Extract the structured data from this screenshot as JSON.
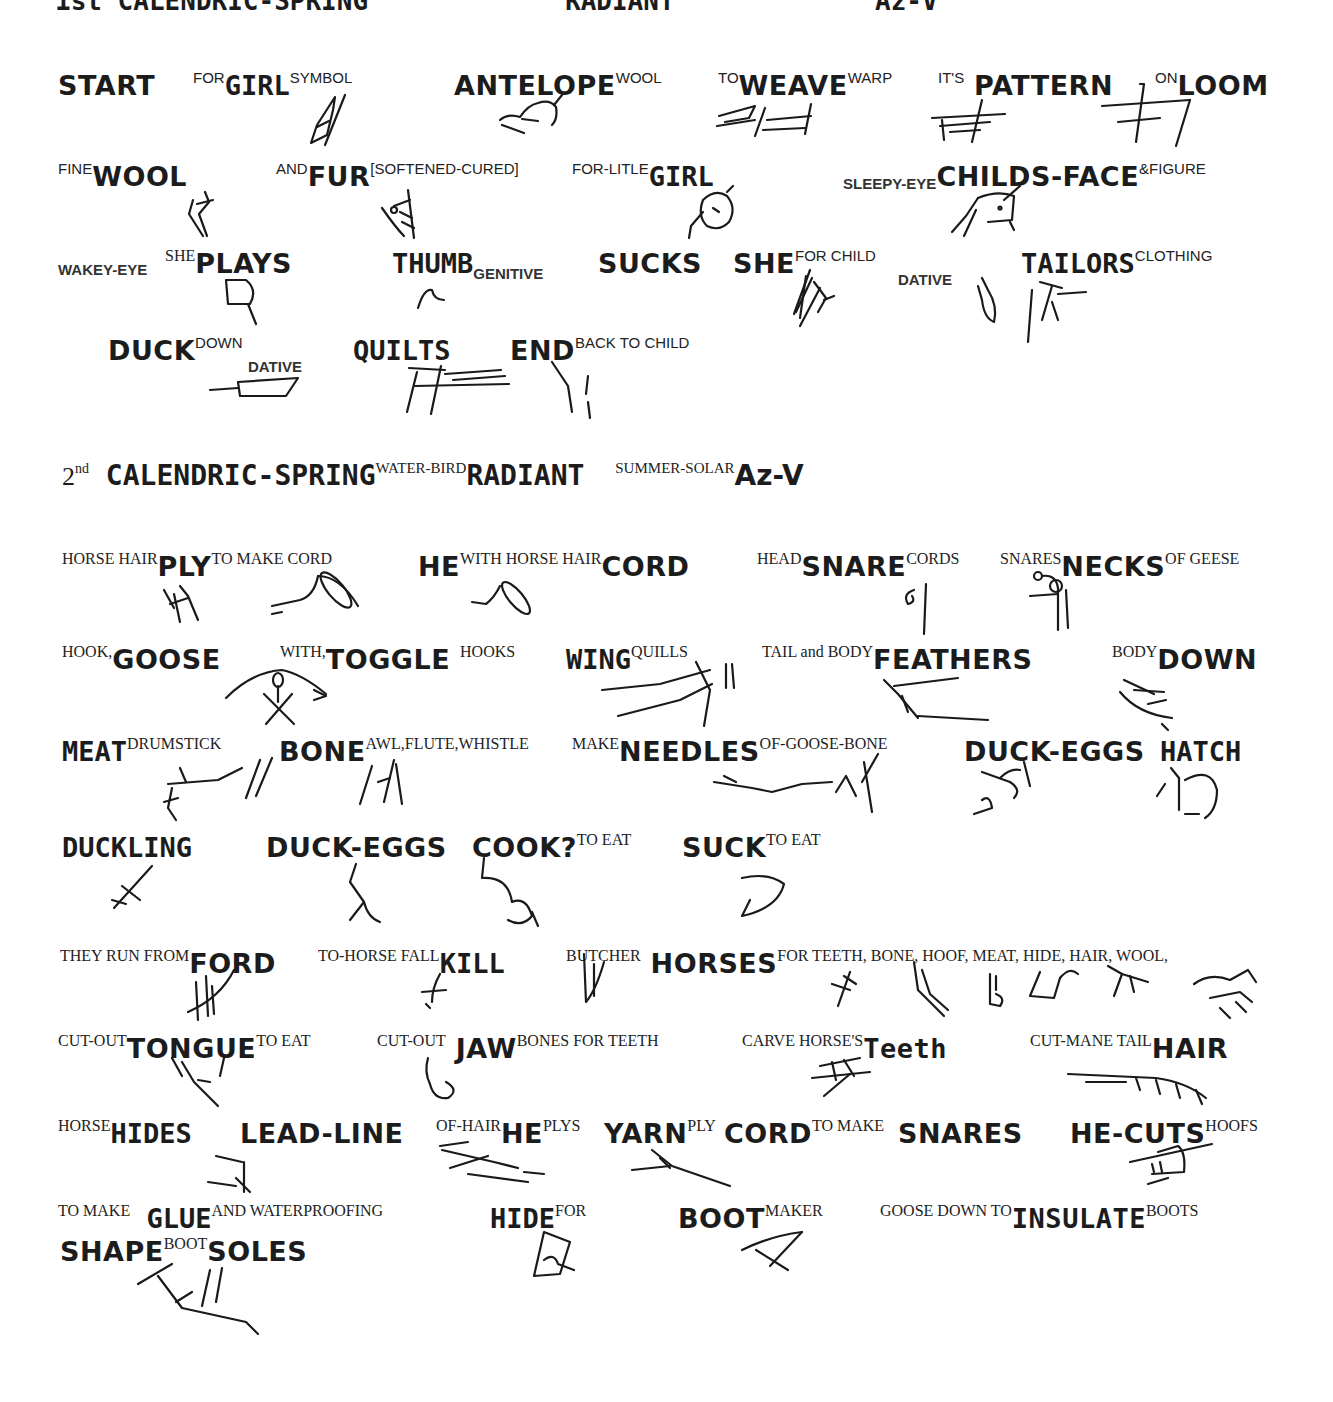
{
  "header_cutoff": {
    "text": "1st CALENDRIC-SPRING",
    "right_a": "RADIANT",
    "right_b": "Az-V"
  },
  "section1": {
    "rows": [
      [
        {
          "pre": "",
          "word": "START",
          "post": ""
        },
        {
          "pre": "FOR",
          "word": "GIRL",
          "post": "SYMBOL"
        },
        {
          "pre": "",
          "word": "ANTELOPE",
          "post": "WOOL"
        },
        {
          "pre": "TO",
          "word": "WEAVE",
          "post": "WARP"
        },
        {
          "pre": "IT'S",
          "word": "PATTERN",
          "post": ""
        },
        {
          "pre": "ON",
          "word": "LOOM",
          "post": ""
        }
      ],
      [
        {
          "pre": "FINE",
          "word": "WOOL",
          "post": ""
        },
        {
          "pre": "AND",
          "word": "FUR",
          "post": "[SOFTENED-CURED]"
        },
        {
          "pre": "FOR-LITLE",
          "word": "GIRL",
          "post": ""
        },
        {
          "pre": "SLEEPY-EYE",
          "word": "CHILDS-FACE",
          "post": "&FIGURE"
        }
      ],
      [
        {
          "pre": "WAKEY-EYE",
          "word": "",
          "post": ""
        },
        {
          "pre": "SHE",
          "word": "PLAYS",
          "post": ""
        },
        {
          "pre": "",
          "word": "THUMB",
          "sub": "GENITIVE",
          "post": ""
        },
        {
          "pre": "",
          "word": "SUCKS",
          "post": ""
        },
        {
          "pre": "",
          "word": "SHE",
          "post": "FOR CHILD"
        },
        {
          "pre": "",
          "word": "",
          "sub": "DATIVE",
          "post": ""
        },
        {
          "pre": "",
          "word": "TAILORS",
          "post": "CLOTHING"
        }
      ],
      [
        {
          "pre": "",
          "word": "DUCK",
          "post": "DOWN"
        },
        {
          "pre": "",
          "word": "",
          "sub": "DATIVE",
          "post": ""
        },
        {
          "pre": "",
          "word": "QUILTS",
          "post": ""
        },
        {
          "pre": "",
          "word": "END",
          "post": "BACK TO CHILD"
        }
      ]
    ]
  },
  "section2": {
    "heading": {
      "ordinal": "2",
      "ordinal_suffix": "nd",
      "title": "CALENDRIC-SPRING",
      "pre_radiant": "WATER-BIRD",
      "radiant": "RADIANT",
      "pre_az": "SUMMER-SOLAR",
      "az": "Az-V"
    },
    "rows": [
      [
        {
          "pre": "HORSE HAIR",
          "word": "PLY",
          "post": "TO MAKE CORD"
        },
        {
          "pre": "",
          "word": "HE",
          "post": "WITH HORSE HAIR"
        },
        {
          "pre": "",
          "word": "CORD",
          "post": ""
        },
        {
          "pre": "HEAD",
          "word": "SNARE",
          "post": "CORDS"
        },
        {
          "pre": "SNARES",
          "word": "NECKS",
          "post": "OF GEESE"
        }
      ],
      [
        {
          "pre": "HOOK,",
          "word": "GOOSE",
          "post": ""
        },
        {
          "pre": "WITH,",
          "word": "TOGGLE",
          "post": "HOOKS"
        },
        {
          "pre": "",
          "word": "WING",
          "post": "QUILLS"
        },
        {
          "pre": "TAIL and BODY",
          "word": "FEATHERS",
          "post": ""
        },
        {
          "pre": "BODY",
          "word": "DOWN",
          "post": ""
        }
      ],
      [
        {
          "pre": "",
          "word": "MEAT",
          "post": "DRUMSTICK"
        },
        {
          "pre": "",
          "word": "BONE",
          "post": "AWL,FLUTE,WHISTLE"
        },
        {
          "pre": "MAKE",
          "word": "NEEDLES",
          "post": "OF-GOOSE-BONE"
        },
        {
          "pre": "",
          "word": "DUCK-EGGS",
          "post": ""
        },
        {
          "pre": "",
          "word": "HATCH",
          "post": ""
        }
      ],
      [
        {
          "pre": "",
          "word": "DUCKLING",
          "post": ""
        },
        {
          "pre": "",
          "word": "DUCK-EGGS",
          "post": ""
        },
        {
          "pre": "",
          "word": "COOK?",
          "post": "TO EAT"
        },
        {
          "pre": "",
          "word": "SUCK",
          "post": "TO EAT"
        }
      ],
      [
        {
          "pre": "THEY RUN FROM",
          "word": "FORD",
          "post": ""
        },
        {
          "pre": "TO-HORSE FALL",
          "word": "KILL",
          "post": ""
        },
        {
          "pre": "BUTCHER",
          "word": "HORSES",
          "post": "FOR TEETH, BONE, HOOF, MEAT, HIDE, HAIR, WOOL,"
        }
      ],
      [
        {
          "pre": "CUT-OUT",
          "word": "TONGUE",
          "post": "TO EAT"
        },
        {
          "pre": "CUT-OUT",
          "word": "JAW",
          "post": "BONES FOR TEETH"
        },
        {
          "pre": "CARVE HORSE'S",
          "word": "Teeth",
          "post": ""
        },
        {
          "pre": "CUT-MANE TAIL",
          "word": "HAIR",
          "post": ""
        }
      ],
      [
        {
          "pre": "HORSE",
          "word": "HIDES",
          "post": ""
        },
        {
          "pre": "",
          "word": "LEAD-LINE",
          "post": ""
        },
        {
          "pre": "OF-HAIR",
          "word": "HE",
          "post": "PLYS"
        },
        {
          "pre": "",
          "word": "YARN",
          "post": "PLY"
        },
        {
          "pre": "",
          "word": "CORD",
          "post": "TO MAKE"
        },
        {
          "pre": "",
          "word": "SNARES",
          "post": ""
        },
        {
          "pre": "",
          "word": "HE-CUTS",
          "post": "HOOFS"
        }
      ],
      [
        {
          "pre": "TO MAKE",
          "word": "GLUE",
          "post": "AND WATERPROOFING"
        },
        {
          "pre": "",
          "word": "HIDE",
          "post": "FOR"
        },
        {
          "pre": "",
          "word": "BOOT",
          "post": "MAKER"
        },
        {
          "pre": "GOOSE DOWN TO",
          "word": "INSULATE",
          "post": "BOOTS"
        }
      ],
      [
        {
          "pre": "",
          "word": "SHAPE",
          "post": "BOOT"
        },
        {
          "pre": "",
          "word": "SOLES",
          "post": ""
        }
      ]
    ]
  },
  "glyphs": [
    "girl-symbol-glyph",
    "antelope-glyph",
    "weave-glyph",
    "pattern-glyph",
    "loom-glyph",
    "wool-glyph",
    "fur-glyph",
    "girl-face-glyph",
    "childs-face-glyph",
    "plays-glyph",
    "thumb-glyph",
    "she-glyph",
    "dative-glyph",
    "tailors-glyph",
    "duck-down-glyph",
    "quilts-glyph",
    "end-glyph",
    "ply-glyph",
    "cord-glyph",
    "he-cord-glyph",
    "snare-glyph",
    "necks-glyph",
    "goose-toggle-glyph",
    "wing-glyph",
    "feathers-glyph",
    "down-glyph",
    "meat-glyph",
    "bone-glyph",
    "needles-glyph",
    "duck-eggs-glyph",
    "hatch-glyph",
    "duckling-glyph",
    "duck-eggs-2-glyph",
    "cook-glyph",
    "suck-glyph",
    "ford-glyph",
    "kill-glyph",
    "butcher-glyph",
    "teeth-glyph",
    "bone-2-glyph",
    "hoof-glyph",
    "meat-2-glyph",
    "hide-glyph",
    "hair-wool-glyph",
    "tongue-glyph",
    "jaw-glyph",
    "carve-teeth-glyph",
    "mane-tail-glyph",
    "hides-glyph",
    "lead-line-glyph",
    "yarn-glyph",
    "hooves-glyph",
    "hide-boot-glyph",
    "boot-maker-glyph",
    "soles-glyph"
  ]
}
